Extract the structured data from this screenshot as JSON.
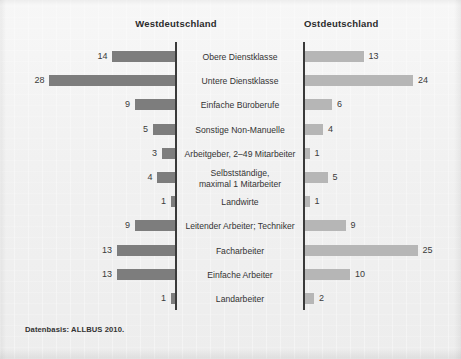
{
  "figure": {
    "background_color": "#f1f1f1",
    "footnote": "Datenbasis: ALLBUS 2010."
  },
  "headings": {
    "left": "Westdeutschland",
    "right": "Ostdeutschland"
  },
  "chart_data": {
    "type": "bar",
    "orientation": "horizontal",
    "layout": "diverging-butterfly-two-panel",
    "title": "",
    "subtitle": "",
    "xlabel": "",
    "ylabel": "",
    "grid": false,
    "legend_position": "top-as-panel-headings",
    "annotations": [
      "Datenbasis: ALLBUS 2010."
    ],
    "axis_ranges": {
      "left_panel": [
        0,
        28
      ],
      "right_panel": [
        0,
        25
      ]
    },
    "value_unit": "percent",
    "categories": [
      "Obere Dienstklasse",
      "Untere Dienstklasse",
      "Einfache Büroberufe",
      "Sonstige Non-Manuelle",
      "Arbeitgeber, 2–49 Mitarbeiter",
      "Selbstständige,\nmaximal 1 Mitarbeiter",
      "Landwirte",
      "Leitender Arbeiter; Techniker",
      "Facharbeiter",
      "Einfache Arbeiter",
      "Landarbeiter"
    ],
    "series": [
      {
        "name": "Westdeutschland",
        "color": "#7d7d7d",
        "side": "left",
        "values": [
          14,
          28,
          9,
          5,
          3,
          4,
          1,
          9,
          13,
          13,
          1
        ]
      },
      {
        "name": "Ostdeutschland",
        "color": "#b6b6b6",
        "side": "right",
        "values": [
          13,
          24,
          6,
          4,
          1,
          5,
          1,
          9,
          25,
          10,
          2
        ]
      }
    ]
  }
}
